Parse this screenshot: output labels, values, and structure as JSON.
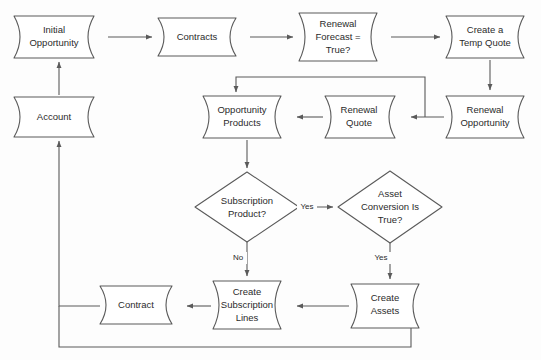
{
  "diagram": {
    "type": "flowchart",
    "canvas": {
      "width": 541,
      "height": 360
    },
    "colors": {
      "stroke": "#5a5a5a",
      "text": "#2b2b2b",
      "shape_fill": "#ffffff",
      "background": "#fdfdfd"
    },
    "nodes": [
      {
        "id": "initial_opportunity",
        "label": "Initial Opportunity",
        "shape": "stored-data",
        "lines": [
          "Initial",
          "Opportunity"
        ],
        "x": 14,
        "y": 16,
        "w": 90,
        "h": 42
      },
      {
        "id": "contracts",
        "label": "Contracts",
        "shape": "stored-data",
        "lines": [
          "Contracts"
        ],
        "x": 158,
        "y": 18,
        "w": 88,
        "h": 38
      },
      {
        "id": "renewal_forecast",
        "label": "Renewal Forecast = True?",
        "shape": "stored-data",
        "lines": [
          "Renewal",
          "Forecast =",
          "True?"
        ],
        "x": 299,
        "y": 13,
        "w": 88,
        "h": 48
      },
      {
        "id": "create_temp_quote",
        "label": "Create a Temp Quote",
        "shape": "stored-data",
        "lines": [
          "Create a",
          "Temp Quote"
        ],
        "x": 446,
        "y": 16,
        "w": 88,
        "h": 42
      },
      {
        "id": "account",
        "label": "Account",
        "shape": "stored-data",
        "lines": [
          "Account"
        ],
        "x": 14,
        "y": 97,
        "w": 90,
        "h": 40
      },
      {
        "id": "opportunity_products",
        "label": "Opportunity Products",
        "shape": "stored-data",
        "lines": [
          "Opportunity",
          "Products"
        ],
        "x": 203,
        "y": 96,
        "w": 88,
        "h": 42
      },
      {
        "id": "renewal_quote",
        "label": "Renewal Quote",
        "shape": "stored-data",
        "lines": [
          "Renewal",
          "Quote"
        ],
        "x": 325,
        "y": 96,
        "w": 80,
        "h": 42
      },
      {
        "id": "renewal_opportunity",
        "label": "Renewal Opportunity",
        "shape": "stored-data",
        "lines": [
          "Renewal",
          "Opportunity"
        ],
        "x": 446,
        "y": 96,
        "w": 88,
        "h": 42
      },
      {
        "id": "subscription_product",
        "label": "Subscription Product?",
        "shape": "decision",
        "lines": [
          "Subscription",
          "Product?"
        ],
        "cx": 247,
        "cy": 207,
        "rx": 52,
        "ry": 35
      },
      {
        "id": "asset_conversion",
        "label": "Asset Conversion Is True?",
        "shape": "decision",
        "lines": [
          "Asset",
          "Conversion Is",
          "True?"
        ],
        "cx": 390,
        "cy": 207,
        "rx": 52,
        "ry": 36
      },
      {
        "id": "contract",
        "label": "Contract",
        "shape": "stored-data",
        "lines": [
          "Contract"
        ],
        "x": 100,
        "y": 286,
        "w": 82,
        "h": 38
      },
      {
        "id": "create_subscription_lines",
        "label": "Create Subscription Lines",
        "shape": "stored-data",
        "lines": [
          "Create",
          "Subscription",
          "Lines"
        ],
        "x": 213,
        "y": 281,
        "w": 78,
        "h": 48
      },
      {
        "id": "create_assets",
        "label": "Create Assets",
        "shape": "stored-data",
        "lines": [
          "Create",
          "Assets"
        ],
        "x": 351,
        "y": 284,
        "w": 78,
        "h": 44
      }
    ],
    "edges": [
      {
        "from": "initial_opportunity",
        "to": "contracts",
        "label": ""
      },
      {
        "from": "contracts",
        "to": "renewal_forecast",
        "label": ""
      },
      {
        "from": "renewal_forecast",
        "to": "create_temp_quote",
        "label": ""
      },
      {
        "from": "create_temp_quote",
        "to": "renewal_opportunity",
        "label": ""
      },
      {
        "from": "renewal_opportunity",
        "to": "renewal_quote",
        "label": ""
      },
      {
        "from": "renewal_quote",
        "to": "opportunity_products",
        "label": ""
      },
      {
        "from": "renewal_opportunity",
        "to": "opportunity_products",
        "label": "",
        "note": "loop back over the top"
      },
      {
        "from": "opportunity_products",
        "to": "subscription_product",
        "label": ""
      },
      {
        "from": "subscription_product",
        "to": "asset_conversion",
        "label": "Yes"
      },
      {
        "from": "subscription_product",
        "to": "create_subscription_lines",
        "label": "No"
      },
      {
        "from": "asset_conversion",
        "to": "create_assets",
        "label": "Yes"
      },
      {
        "from": "create_assets",
        "to": "create_subscription_lines",
        "label": ""
      },
      {
        "from": "create_subscription_lines",
        "to": "contract",
        "label": ""
      },
      {
        "from": "contract",
        "to": "account",
        "label": ""
      },
      {
        "from": "account",
        "to": "initial_opportunity",
        "label": ""
      },
      {
        "from": "create_assets",
        "to": "account",
        "label": "",
        "note": "loop back along the bottom"
      }
    ],
    "edge_labels": [
      {
        "id": "yes-subscription",
        "text": "Yes",
        "x": 307,
        "y": 207
      },
      {
        "id": "no-subscription",
        "text": "No",
        "x": 238,
        "y": 258
      },
      {
        "id": "yes-asset",
        "text": "Yes",
        "x": 381,
        "y": 258
      }
    ]
  }
}
